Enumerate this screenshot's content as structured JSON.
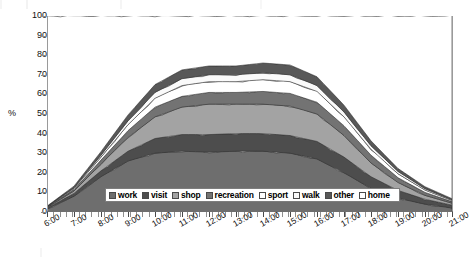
{
  "chart_data": {
    "type": "area",
    "stacked": true,
    "title": "",
    "subtitle": "",
    "xlabel": "",
    "ylabel": "%",
    "ylim": [
      0,
      100
    ],
    "ytick_values": [
      0,
      10,
      20,
      30,
      40,
      50,
      60,
      70,
      80,
      90,
      100
    ],
    "ytick_labels": [
      "0",
      "10",
      "20",
      "30",
      "40",
      "50",
      "60",
      "70",
      "80",
      "90",
      "100"
    ],
    "grid": false,
    "legend_position": "inside-bottom-center",
    "x": [
      "6:00",
      "7:00",
      "8:00",
      "9:00",
      "10:00",
      "11:00",
      "12:00",
      "13:00",
      "14:00",
      "15:00",
      "16:00",
      "17:00",
      "18:00",
      "19:00",
      "20:00",
      "21:00"
    ],
    "xtick_labels": [
      "6:00",
      "7:00",
      "8:00",
      "9:00",
      "10:00",
      "11:00",
      "12:00",
      "13:00",
      "14:00",
      "15:00",
      "16:00",
      "17:00",
      "18:00",
      "19:00",
      "20:00",
      "21:00"
    ],
    "series": [
      {
        "name": "work",
        "color": "#6e6e6e",
        "values": [
          1.5,
          8.0,
          18.0,
          26.0,
          30.0,
          31.0,
          30.5,
          31.0,
          31.0,
          30.0,
          27.0,
          20.0,
          12.0,
          7.0,
          4.0,
          2.0
        ]
      },
      {
        "name": "visit",
        "color": "#4d4d4d",
        "values": [
          0.5,
          1.5,
          3.0,
          5.0,
          7.5,
          8.5,
          9.0,
          9.0,
          9.0,
          9.0,
          9.0,
          8.0,
          6.0,
          4.0,
          2.5,
          1.5
        ]
      },
      {
        "name": "shop",
        "color": "#a3a3a3",
        "values": [
          0.3,
          1.2,
          3.5,
          7.0,
          11.0,
          14.0,
          15.5,
          15.0,
          15.0,
          15.0,
          14.0,
          11.0,
          7.0,
          4.0,
          2.0,
          1.0
        ]
      },
      {
        "name": "recreation",
        "color": "#737373",
        "values": [
          0.2,
          0.8,
          2.0,
          3.5,
          5.0,
          5.5,
          6.0,
          6.0,
          6.5,
          6.5,
          6.0,
          5.0,
          4.0,
          2.5,
          1.5,
          0.8
        ]
      },
      {
        "name": "sport",
        "color": "#ffffff",
        "values": [
          0.2,
          0.6,
          1.5,
          3.0,
          4.5,
          5.5,
          5.5,
          5.5,
          6.0,
          6.0,
          5.5,
          4.5,
          3.0,
          2.0,
          1.2,
          0.6
        ]
      },
      {
        "name": "walk",
        "color": "#fafafa",
        "values": [
          0.1,
          0.4,
          1.0,
          2.0,
          3.0,
          3.5,
          3.5,
          3.5,
          3.5,
          3.5,
          3.0,
          2.5,
          1.8,
          1.2,
          0.7,
          0.4
        ]
      },
      {
        "name": "other",
        "color": "#585858",
        "values": [
          0.2,
          0.7,
          1.8,
          3.0,
          4.0,
          4.5,
          4.5,
          4.5,
          5.0,
          5.0,
          4.5,
          3.5,
          2.5,
          1.5,
          1.0,
          0.5
        ]
      },
      {
        "name": "home",
        "color": "#ffffff",
        "values": [
          97.0,
          86.8,
          69.2,
          50.5,
          35.0,
          27.5,
          25.5,
          25.5,
          24.0,
          25.0,
          31.0,
          45.5,
          63.7,
          77.8,
          87.1,
          93.2
        ]
      }
    ]
  },
  "axis": {
    "y_title": "%"
  },
  "legend": {
    "items": [
      {
        "label": "work",
        "color": "#6e6e6e"
      },
      {
        "label": "visit",
        "color": "#4d4d4d"
      },
      {
        "label": "shop",
        "color": "#a3a3a3"
      },
      {
        "label": "recreation",
        "color": "#737373"
      },
      {
        "label": "sport",
        "color": "#ffffff"
      },
      {
        "label": "walk",
        "color": "#fafafa"
      },
      {
        "label": "other",
        "color": "#585858"
      },
      {
        "label": "home",
        "color": "#ffffff"
      }
    ]
  }
}
